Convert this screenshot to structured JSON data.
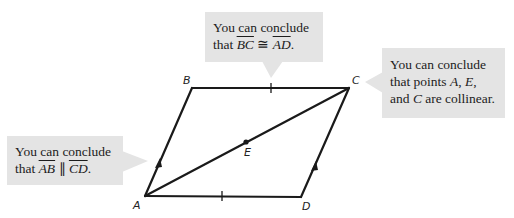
{
  "figure": {
    "vertices": [
      {
        "label": "A",
        "x": 145,
        "y": 196
      },
      {
        "label": "B",
        "x": 192,
        "y": 88
      },
      {
        "label": "C",
        "x": 349,
        "y": 88
      },
      {
        "label": "D",
        "x": 301,
        "y": 197
      }
    ],
    "midpoint": {
      "label": "E",
      "x": 246,
      "y": 142
    },
    "segments": [
      "AB",
      "BC",
      "CD",
      "DA",
      "AC"
    ],
    "marks": {
      "congruent_ticks": [
        "BC",
        "AD"
      ],
      "parallel_arrows": [
        "AB",
        "CD"
      ]
    },
    "colors": {
      "line": "#1a1a1a",
      "callout_bg": "#e4e4e4"
    }
  },
  "callouts": {
    "top": {
      "line1": "You can conclude",
      "line2_prefix": "that ",
      "seg1": "BC",
      "relation": " ≅ ",
      "seg2": "AD",
      "suffix": "."
    },
    "right": {
      "line1": "You can conclude",
      "line2_prefix": "that points ",
      "p1": "A",
      "sep1": ", ",
      "p2": "E",
      "sep2": ",",
      "line3_prefix": "and ",
      "p3": "C",
      "line3_suffix": " are collinear."
    },
    "left": {
      "line1": "You can conclude",
      "line2_prefix": "that ",
      "seg1": "AB",
      "relation": " ∥ ",
      "seg2": "CD",
      "suffix": "."
    }
  }
}
